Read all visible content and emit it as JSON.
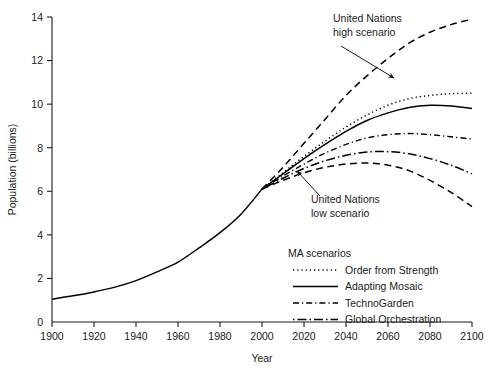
{
  "chart_data": {
    "type": "line",
    "title": "",
    "xlabel": "Year",
    "ylabel": "Population (billions)",
    "xlim": [
      1900,
      2100
    ],
    "ylim": [
      0,
      14
    ],
    "xticks": [
      1900,
      1920,
      1940,
      1960,
      1980,
      2000,
      2020,
      2040,
      2060,
      2080,
      2100
    ],
    "yticks": [
      0,
      2,
      4,
      6,
      8,
      10,
      12,
      14
    ],
    "grid": false,
    "legend_position": "lower-right-inside",
    "legend_title": "MA scenarios",
    "x": [
      1900,
      1910,
      1920,
      1930,
      1940,
      1950,
      1960,
      1970,
      1980,
      1990,
      2000,
      2010,
      2020,
      2030,
      2040,
      2050,
      2060,
      2070,
      2080,
      2090,
      2100
    ],
    "series": [
      {
        "name": "Historical",
        "style": "solid",
        "in_legend": false,
        "x": [
          1900,
          1910,
          1920,
          1930,
          1940,
          1950,
          1960,
          1970,
          1980,
          1990,
          2000
        ],
        "values": [
          1.05,
          1.2,
          1.38,
          1.6,
          1.9,
          2.3,
          2.75,
          3.4,
          4.1,
          4.95,
          6.1
        ]
      },
      {
        "name": "United Nations high scenario",
        "style": "dashed",
        "in_legend": false,
        "x": [
          2000,
          2010,
          2020,
          2030,
          2040,
          2050,
          2060,
          2070,
          2080,
          2090,
          2100
        ],
        "values": [
          6.1,
          7.1,
          8.2,
          9.3,
          10.4,
          11.3,
          12.1,
          12.8,
          13.3,
          13.65,
          13.9
        ]
      },
      {
        "name": "Order from Strength",
        "style": "dotted",
        "in_legend": true,
        "x": [
          2000,
          2010,
          2020,
          2030,
          2040,
          2050,
          2060,
          2070,
          2080,
          2090,
          2100
        ],
        "values": [
          6.1,
          6.85,
          7.6,
          8.3,
          8.95,
          9.5,
          9.95,
          10.25,
          10.4,
          10.48,
          10.5
        ]
      },
      {
        "name": "Adapting Mosaic",
        "style": "solid",
        "in_legend": true,
        "x": [
          2000,
          2010,
          2020,
          2030,
          2040,
          2050,
          2060,
          2070,
          2080,
          2090,
          2100
        ],
        "values": [
          6.1,
          6.8,
          7.5,
          8.15,
          8.75,
          9.25,
          9.6,
          9.85,
          9.95,
          9.92,
          9.8
        ]
      },
      {
        "name": "TechnoGarden",
        "style": "dashdot-short",
        "in_legend": true,
        "x": [
          2000,
          2010,
          2020,
          2030,
          2040,
          2050,
          2060,
          2070,
          2080,
          2090,
          2100
        ],
        "values": [
          6.1,
          6.7,
          7.25,
          7.75,
          8.15,
          8.45,
          8.6,
          8.65,
          8.6,
          8.5,
          8.4
        ]
      },
      {
        "name": "Global Orchestration",
        "style": "dashdot-long",
        "in_legend": true,
        "x": [
          2000,
          2010,
          2020,
          2030,
          2040,
          2050,
          2060,
          2070,
          2080,
          2090,
          2100
        ],
        "values": [
          6.1,
          6.6,
          7.05,
          7.4,
          7.65,
          7.8,
          7.82,
          7.72,
          7.5,
          7.2,
          6.8
        ]
      },
      {
        "name": "United Nations low scenario",
        "style": "dashed",
        "in_legend": false,
        "x": [
          2000,
          2010,
          2020,
          2030,
          2040,
          2050,
          2060,
          2070,
          2080,
          2090,
          2100
        ],
        "values": [
          6.1,
          6.5,
          6.85,
          7.1,
          7.25,
          7.3,
          7.2,
          6.95,
          6.5,
          5.95,
          5.3
        ]
      }
    ],
    "legend_entries": [
      {
        "label": "Order from Strength",
        "style": "dotted"
      },
      {
        "label": "Adapting Mosaic",
        "style": "solid"
      },
      {
        "label": "TechnoGarden",
        "style": "dashdot-short"
      },
      {
        "label": "Global Orchestration",
        "style": "dashdot-long"
      }
    ],
    "annotations": [
      {
        "id": "un-high",
        "line1": "United Nations",
        "line2": "high scenario",
        "text_x": 333,
        "text_y": 22,
        "arrow_from_x": 341,
        "arrow_from_y": 46,
        "arrow_to_x": 394,
        "arrow_to_y": 78
      },
      {
        "id": "un-low",
        "line1": "United Nations",
        "line2": "low scenario",
        "text_x": 311,
        "text_y": 203,
        "arrow_from_x": 320,
        "arrow_from_y": 196,
        "arrow_to_x": 297,
        "arrow_to_y": 171
      }
    ]
  },
  "axes": {
    "x_tick_labels": [
      "1900",
      "1920",
      "1940",
      "1960",
      "1980",
      "2000",
      "2020",
      "2040",
      "2060",
      "2080",
      "2100"
    ],
    "y_tick_labels": [
      "0",
      "2",
      "4",
      "6",
      "8",
      "10",
      "12",
      "14"
    ],
    "x_title": "Year",
    "y_title": "Population (billions)"
  },
  "colors": {
    "ink": "#1a1a1a",
    "line": "#000000",
    "background": "#ffffff"
  }
}
